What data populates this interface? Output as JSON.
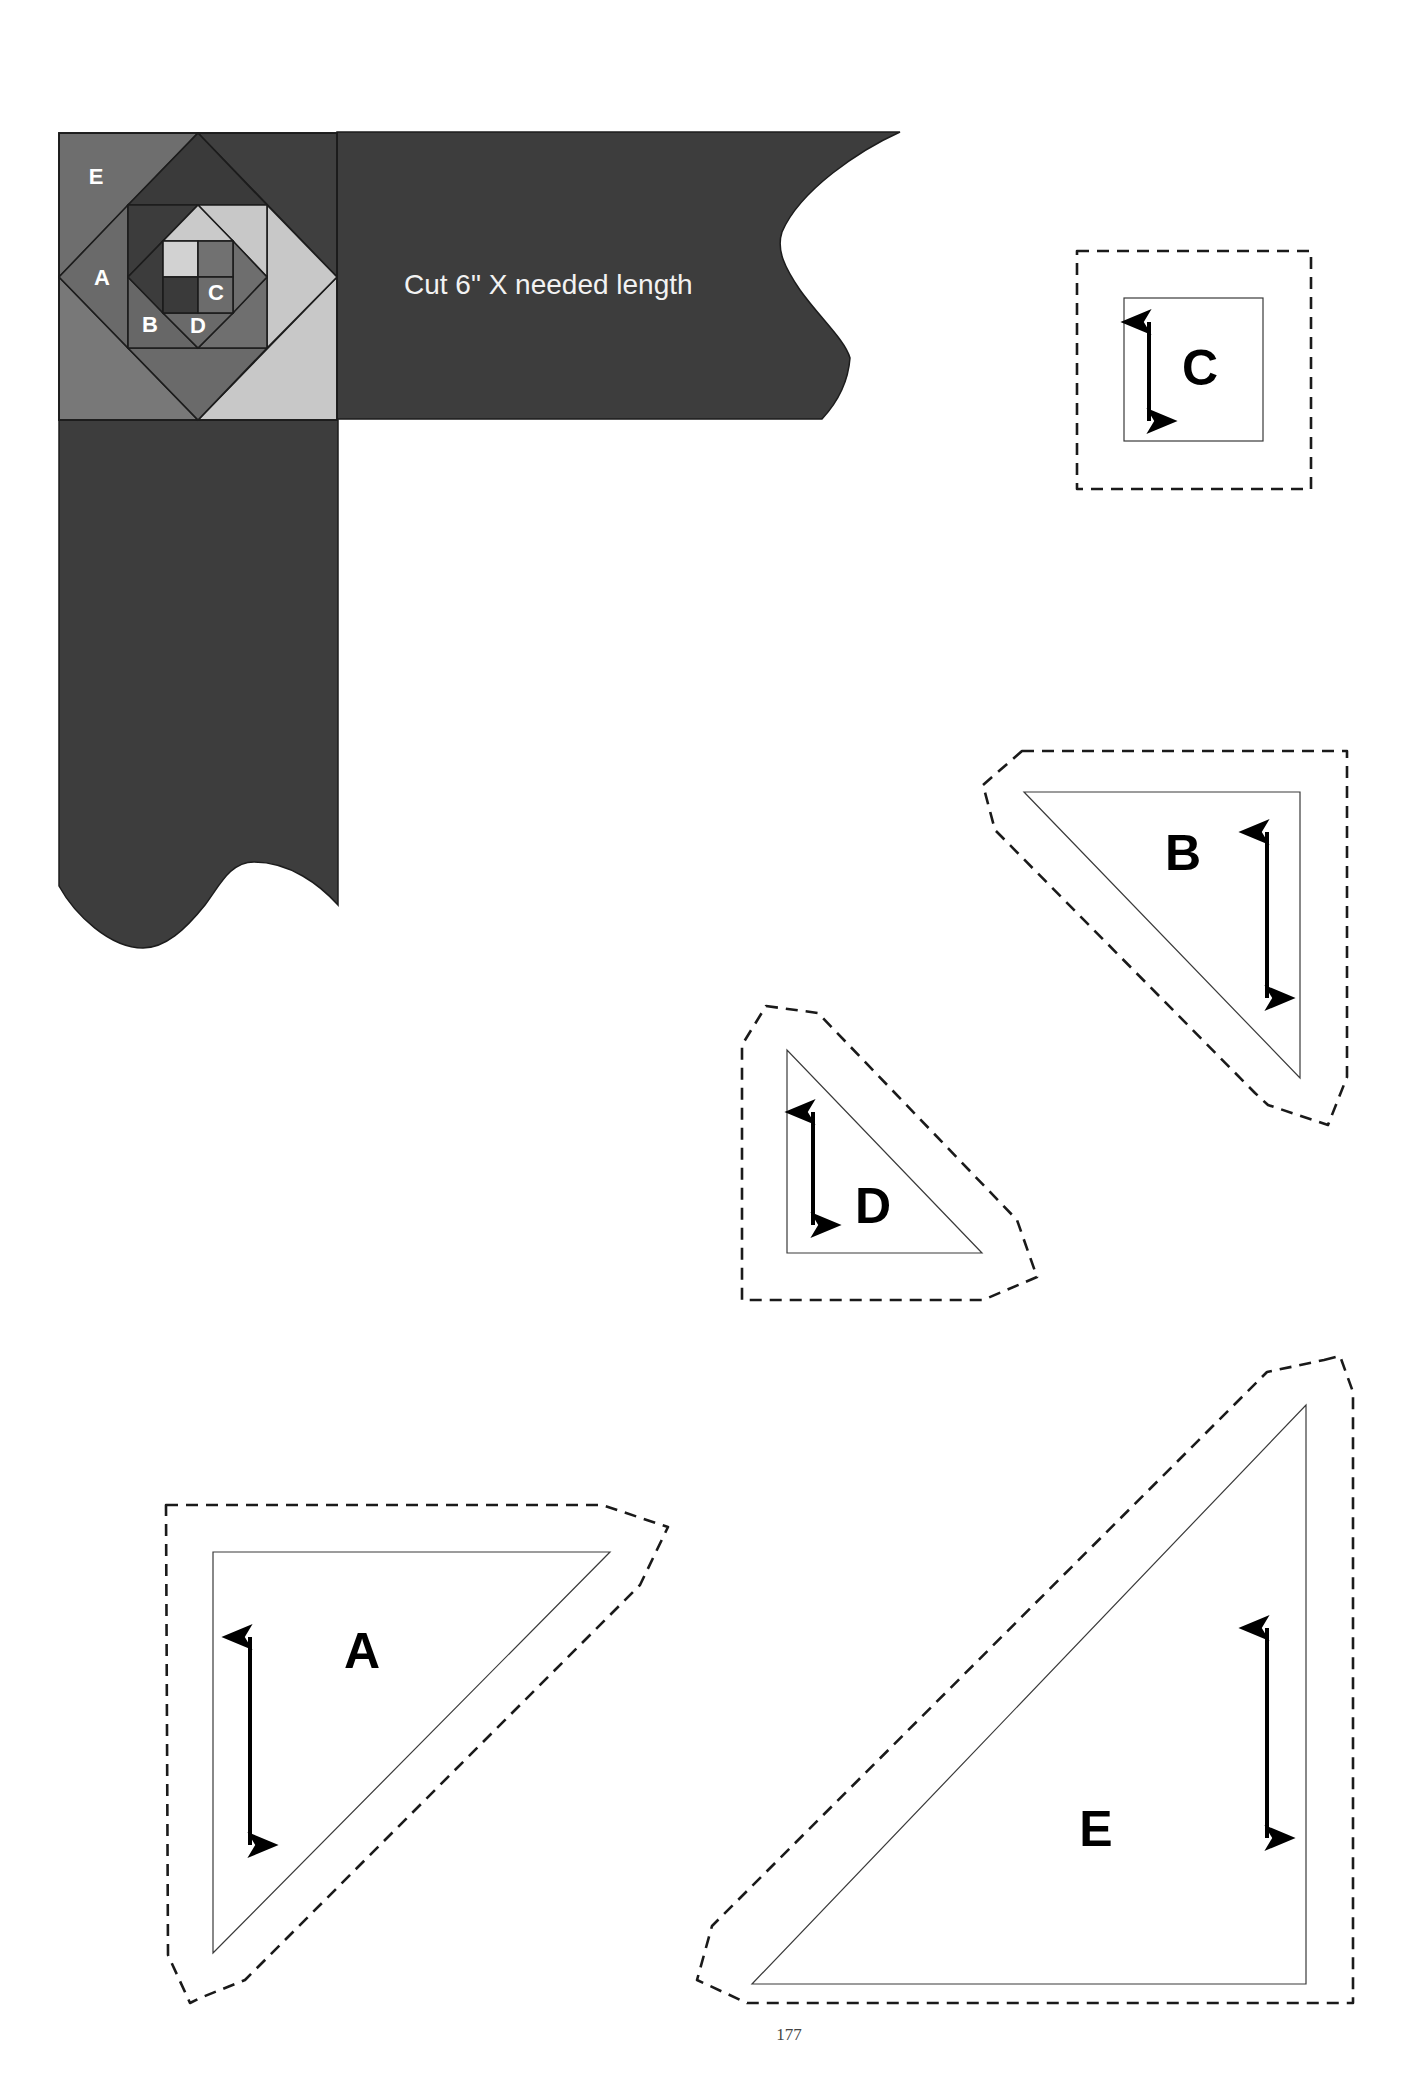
{
  "page": {
    "number": "177",
    "background": "#ffffff"
  },
  "border_diagram": {
    "instruction": "Cut 6\" X needed length",
    "strip_color": "#3d3d3d",
    "block_labels": {
      "E": "E",
      "A": "A",
      "B": "B",
      "C": "C",
      "D": "D"
    },
    "colors": {
      "dark": "#3c3c3c",
      "medium": "#6c6c6c",
      "light": "#c8c8c8",
      "lightest": "#d2d2d2"
    }
  },
  "templates": [
    {
      "id": "C",
      "label": "C",
      "shape": "square",
      "grainline": "vertical"
    },
    {
      "id": "B",
      "label": "B",
      "shape": "right-triangle",
      "grainline": "vertical"
    },
    {
      "id": "D",
      "label": "D",
      "shape": "right-triangle",
      "grainline": "vertical"
    },
    {
      "id": "A",
      "label": "A",
      "shape": "right-triangle",
      "grainline": "vertical"
    },
    {
      "id": "E",
      "label": "E",
      "shape": "right-triangle",
      "grainline": "vertical"
    }
  ],
  "legend": {
    "solid_line": "cutting line",
    "dashed_line": "seam allowance"
  }
}
